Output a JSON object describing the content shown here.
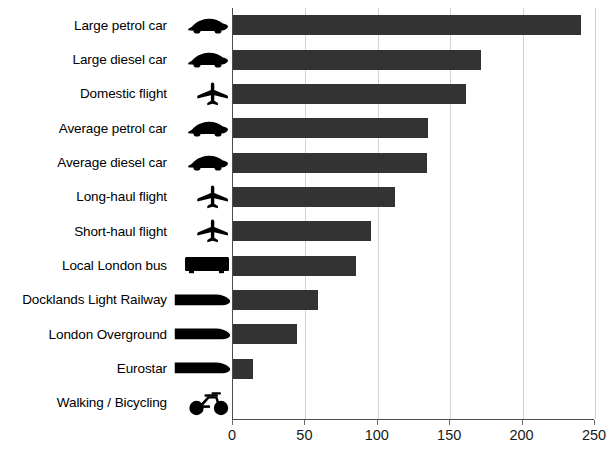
{
  "chart_data": {
    "type": "bar",
    "orientation": "horizontal",
    "title": "",
    "subtitle": "",
    "xlabel": "",
    "ylabel": "",
    "xlim": [
      0,
      250
    ],
    "xticks": [
      0,
      50,
      100,
      150,
      200,
      250
    ],
    "grid": true,
    "legend": null,
    "bar_color": "#333333",
    "categories": [
      "Large petrol car",
      "Large diesel car",
      "Domestic flight",
      "Average petrol car",
      "Average diesel car",
      "Long-haul flight",
      "Short-haul flight",
      "Local London bus",
      "Docklands Light Railway",
      "London Overground",
      "Eurostar",
      "Walking / Bicycling"
    ],
    "values": [
      240,
      171,
      161,
      135,
      134,
      112,
      95,
      85,
      59,
      44,
      14,
      0
    ],
    "icons": [
      "car-icon",
      "car-icon",
      "airplane-icon",
      "car-icon",
      "car-icon",
      "airplane-icon",
      "airplane-icon",
      "bus-icon",
      "train-icon",
      "train-icon",
      "train-icon",
      "bicycle-icon"
    ]
  },
  "axis": {
    "tick_labels": [
      "0",
      "50",
      "100",
      "150",
      "200",
      "250"
    ]
  }
}
